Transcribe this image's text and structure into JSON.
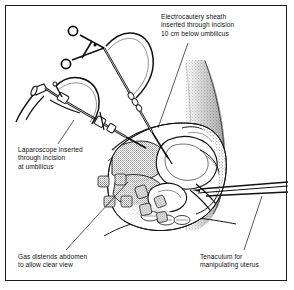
{
  "figure": {
    "style": "black-and-white line drawing with stipple shading",
    "frame_color": "#1b1b1b",
    "background_color": "#ffffff",
    "ink_color": "#111111"
  },
  "captions": {
    "electrocautery": "Electrocautery sheath\ninserted through incision\n10 cm below umbilicus",
    "laparoscope": "Laparoscope inserted\nthrough incision\nat umbilicus",
    "gas": "Gas distends abdomen\nto allow clear view",
    "tenaculum": "Tenaculum for\nmanipulating uterus"
  },
  "parts": {
    "electrocautery_instrument": "electrocautery sheath with ring-handle grip and coiled cord",
    "laparoscope_instrument": "laparoscope with eyepiece and fiber-optic light cable",
    "tenaculum_instrument": "tenaculum entering from the right to manipulate the uterus",
    "anatomy": "sagittal section of female pelvis showing uterus, bladder, bowel and abdominal wall",
    "gas_bubbles": "stippled square fragments indicating insufflation gas in the abdomen"
  },
  "leaders": {
    "electrocautery": "line from caption down-left to sheath tip",
    "laparoscope": "line from caption up-right to laparoscope shaft",
    "gas": "line from caption up-right to gas-filled abdominal cavity",
    "tenaculum": "line from caption up-right to tenaculum shaft"
  }
}
